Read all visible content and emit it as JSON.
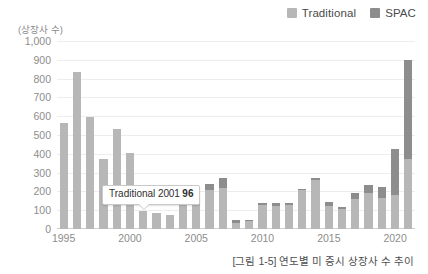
{
  "legend": {
    "position": "top-right",
    "items": [
      {
        "label": "Traditional",
        "color": "#b7b7b7",
        "icon": "legend-swatch-icon"
      },
      {
        "label": "SPAC",
        "color": "#8d8d8d",
        "icon": "legend-swatch-icon"
      }
    ]
  },
  "annotation": {
    "series": "Traditional",
    "year": "2001",
    "value": "96"
  },
  "caption": "[그림 1-5] 연도별 미 증시 상장사 수 추이",
  "chart_data": {
    "type": "bar",
    "stacked": true,
    "title": "",
    "subtitle": "",
    "xlabel": "",
    "ylabel": "(상장사 수)",
    "ylim": [
      0,
      1000
    ],
    "yticks": [
      "1,000",
      "900",
      "800",
      "700",
      "600",
      "500",
      "400",
      "300",
      "200",
      "100",
      "0"
    ],
    "ytick_values": [
      1000,
      900,
      800,
      700,
      600,
      500,
      400,
      300,
      200,
      100,
      0
    ],
    "grid": true,
    "xtick_labels": [
      "1995",
      "2000",
      "2005",
      "2010",
      "2015",
      "2020"
    ],
    "xtick_years": [
      1995,
      2000,
      2005,
      2010,
      2015,
      2020
    ],
    "categories": [
      1995,
      1996,
      1997,
      1998,
      1999,
      2000,
      2001,
      2002,
      2003,
      2004,
      2005,
      2006,
      2007,
      2008,
      2009,
      2010,
      2011,
      2012,
      2013,
      2014,
      2015,
      2016,
      2017,
      2018,
      2019,
      2020,
      2021
    ],
    "series": [
      {
        "name": "Traditional",
        "color": "#b7b7b7",
        "values": [
          565,
          835,
          595,
          370,
          530,
          405,
          96,
          85,
          75,
          220,
          195,
          205,
          220,
          30,
          45,
          130,
          125,
          130,
          205,
          260,
          125,
          105,
          160,
          190,
          165,
          180,
          370
        ]
      },
      {
        "name": "SPAC",
        "color": "#8d8d8d",
        "values": [
          0,
          0,
          0,
          0,
          0,
          0,
          0,
          0,
          0,
          12,
          28,
          37,
          53,
          17,
          1,
          7,
          15,
          9,
          10,
          12,
          20,
          13,
          34,
          46,
          59,
          248,
          530
        ]
      }
    ],
    "legend_position": "top-right"
  }
}
